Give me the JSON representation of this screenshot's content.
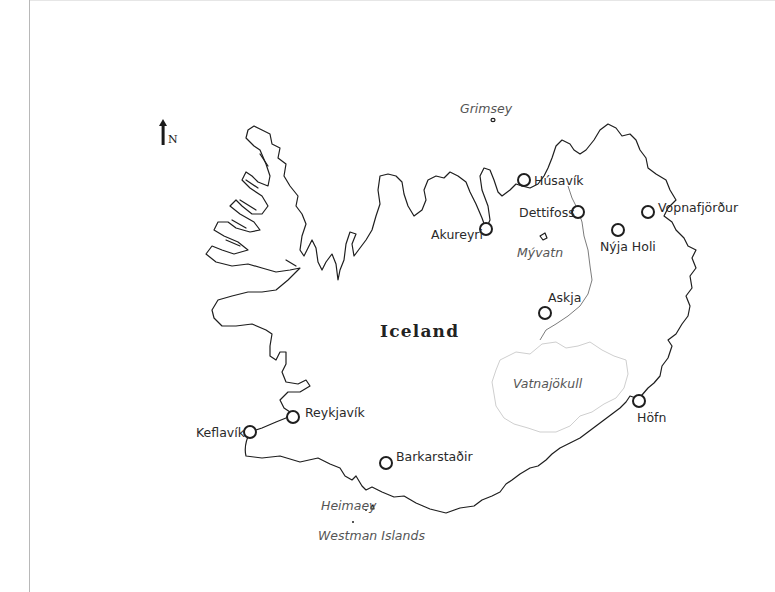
{
  "map": {
    "title": "Iceland",
    "north_label": "N",
    "colors": {
      "coastline": "#1e1e1e",
      "glacier_outline": "#cfcfcf",
      "river": "#5a5a5a",
      "city_marker_fill": "#ffffff",
      "background": "#ffffff"
    },
    "cities": [
      {
        "name": "Húsavík",
        "x": 524,
        "y": 180
      },
      {
        "name": "Akureyri",
        "x": 486,
        "y": 229
      },
      {
        "name": "Dettifoss",
        "x": 578,
        "y": 212
      },
      {
        "name": "Nýja Holi",
        "x": 618,
        "y": 230
      },
      {
        "name": "Vopnafjörður",
        "x": 648,
        "y": 212
      },
      {
        "name": "Askja",
        "x": 545,
        "y": 313
      },
      {
        "name": "Höfn",
        "x": 639,
        "y": 401
      },
      {
        "name": "Reykjavík",
        "x": 293,
        "y": 417
      },
      {
        "name": "Keflavík",
        "x": 250,
        "y": 432
      },
      {
        "name": "Barkarstaðir",
        "x": 386,
        "y": 463
      }
    ],
    "features": [
      {
        "name": "Grimsey",
        "type": "island"
      },
      {
        "name": "Mývatn",
        "type": "lake"
      },
      {
        "name": "Vatnajökull",
        "type": "glacier"
      },
      {
        "name": "Heimaey",
        "type": "island"
      },
      {
        "name": "Westman Islands",
        "type": "island-group"
      }
    ]
  }
}
